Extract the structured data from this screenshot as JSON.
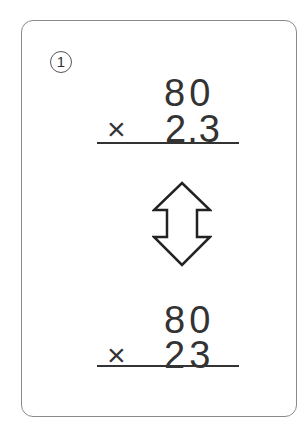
{
  "problem": {
    "number_label": "1",
    "top": {
      "multiplicand": "80",
      "operator": "×",
      "multiplier": "2.3"
    },
    "bottom": {
      "multiplicand": "80",
      "operator": "×",
      "multiplier": "23"
    },
    "icon": "up-down-arrow-icon"
  }
}
